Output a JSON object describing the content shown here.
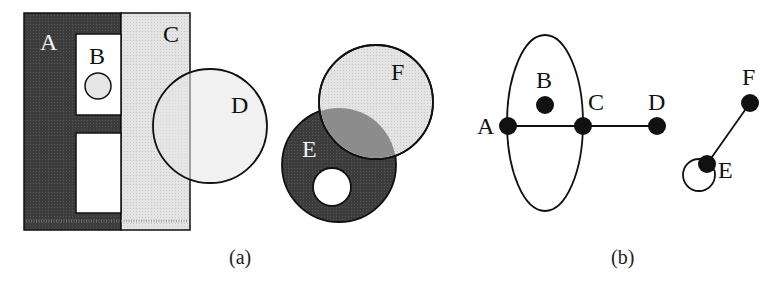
{
  "figure": {
    "panels": [
      {
        "id": "a",
        "caption": "(a)",
        "type": "region-diagram",
        "regions": [
          {
            "label": "A",
            "shape": "rectangle",
            "fill": "dark-gray"
          },
          {
            "label": "B",
            "shape": "rectangle",
            "fill": "white",
            "contains": "small circle"
          },
          {
            "label": "C",
            "shape": "rectangle",
            "fill": "light-gray"
          },
          {
            "label": "D",
            "shape": "circle",
            "fill": "transparent"
          },
          {
            "label": "E",
            "shape": "circle-with-hole",
            "fill": "dark-gray"
          },
          {
            "label": "F",
            "shape": "circle",
            "fill": "light-gray"
          }
        ]
      },
      {
        "id": "b",
        "caption": "(b)",
        "type": "graph",
        "nodes": [
          "A",
          "B",
          "C",
          "D",
          "E",
          "F"
        ],
        "edges": [
          {
            "from": "A",
            "to": "C",
            "kind": "straight"
          },
          {
            "from": "C",
            "to": "D",
            "kind": "straight"
          },
          {
            "from": "A",
            "to": "C",
            "kind": "curved-upper"
          },
          {
            "from": "A",
            "to": "C",
            "kind": "curved-lower"
          },
          {
            "from": "E",
            "to": "F",
            "kind": "straight"
          },
          {
            "from": "E",
            "to": "E",
            "kind": "self-loop"
          }
        ]
      }
    ],
    "labels": {
      "a": {
        "A": "A",
        "B": "B",
        "C": "C",
        "D": "D",
        "E": "E",
        "F": "F"
      },
      "b": {
        "A": "A",
        "B": "B",
        "C": "C",
        "D": "D",
        "E": "E",
        "F": "F"
      }
    },
    "captions": {
      "a": "(a)",
      "b": "(b)"
    },
    "colors": {
      "dark": "#3a3a3a",
      "light": "#dcdcdc",
      "overlap": "#8a8a8a",
      "stroke": "#111111",
      "white": "#ffffff"
    }
  }
}
